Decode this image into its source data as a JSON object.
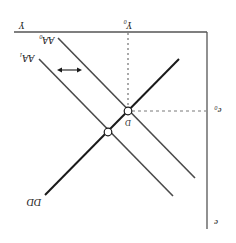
{
  "diagram": {
    "orientation": "rotated-180",
    "colors": {
      "axis": "#555555",
      "dd_line": "#1a1a1a",
      "aa_lines": "#4a4a4a",
      "guides": "#555555",
      "background": "#ffffff"
    },
    "axes": {
      "x_label": "Y",
      "y_label": "e"
    },
    "curves": {
      "dd": {
        "label": "DD"
      },
      "aa0": {
        "label": "AA",
        "sub": "0"
      },
      "aa1": {
        "label": "AA",
        "sub": "1"
      }
    },
    "points": {
      "equilibrium": {
        "label": "D"
      }
    },
    "guides": {
      "y0": {
        "label": "Y",
        "sub": "0"
      },
      "e0": {
        "label": "e",
        "sub": "0"
      }
    },
    "annotations": {
      "shift_arrow": "double-headed arrow indicating AA shift"
    }
  }
}
